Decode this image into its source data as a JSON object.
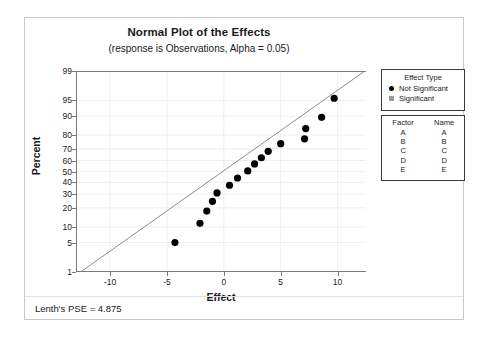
{
  "chart_data": {
    "type": "scatter",
    "title": "Normal Plot of the Effects",
    "subtitle": "(response is Observations, Alpha = 0.05)",
    "xlabel": "Effect",
    "ylabel": "Percent",
    "xlim": [
      -13.0,
      12.5
    ],
    "xticks": [
      -10,
      -5,
      0,
      5,
      10
    ],
    "yticks": [
      1,
      5,
      10,
      20,
      30,
      40,
      50,
      60,
      70,
      80,
      90,
      95,
      99
    ],
    "ylim": [
      1,
      99
    ],
    "grid": true,
    "legend_position": "right",
    "reference_line": {
      "x1": -12.6,
      "y1": 1.0,
      "x2": 12.4,
      "y2": 99.0
    },
    "points": [
      {
        "x": -4.3,
        "y": 5.0,
        "type": "Not Significant"
      },
      {
        "x": -2.1,
        "y": 11.5,
        "type": "Not Significant"
      },
      {
        "x": -1.5,
        "y": 18.0,
        "type": "Not Significant"
      },
      {
        "x": -1.0,
        "y": 24.5,
        "type": "Not Significant"
      },
      {
        "x": -0.6,
        "y": 31.0,
        "type": "Not Significant"
      },
      {
        "x": 0.5,
        "y": 37.5,
        "type": "Not Significant"
      },
      {
        "x": 1.2,
        "y": 44.0,
        "type": "Not Significant"
      },
      {
        "x": 2.1,
        "y": 50.5,
        "type": "Not Significant"
      },
      {
        "x": 2.7,
        "y": 57.0,
        "type": "Not Significant"
      },
      {
        "x": 3.3,
        "y": 62.5,
        "type": "Not Significant"
      },
      {
        "x": 3.9,
        "y": 68.0,
        "type": "Not Significant"
      },
      {
        "x": 5.0,
        "y": 74.0,
        "type": "Not Significant"
      },
      {
        "x": 7.1,
        "y": 77.5,
        "type": "Not Significant"
      },
      {
        "x": 7.2,
        "y": 84.0,
        "type": "Not Significant"
      },
      {
        "x": 8.6,
        "y": 89.5,
        "type": "Not Significant"
      },
      {
        "x": 9.7,
        "y": 95.5,
        "type": "Not Significant"
      }
    ]
  },
  "legend": {
    "effect_type": {
      "heading": "Effect Type",
      "entries": [
        {
          "label": "Not Significant",
          "marker": "circle-filled-icon"
        },
        {
          "label": "Significant",
          "marker": "square-filled-icon"
        }
      ]
    },
    "factor_table": {
      "headers": [
        "Factor",
        "Name"
      ],
      "rows": [
        [
          "A",
          "A"
        ],
        [
          "B",
          "B"
        ],
        [
          "C",
          "C"
        ],
        [
          "D",
          "D"
        ],
        [
          "E",
          "E"
        ]
      ]
    }
  },
  "footnote": "Lenth's PSE = 4.875",
  "colors": {
    "point": "#000000",
    "significant_marker": "#9a9a9a",
    "reference_line": "#8c8c8c",
    "grid": "#efefef",
    "axis": "#7a7a7a",
    "frame": "#c8c8c8"
  }
}
